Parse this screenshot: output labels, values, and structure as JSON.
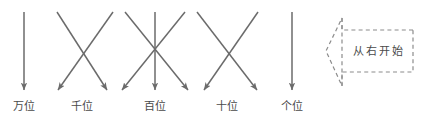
{
  "canvas": {
    "width": 425,
    "height": 126,
    "background_color": "#ffffff",
    "line_color": "#6b6b6b",
    "dashed_color": "#8c8c8c",
    "text_color": "#4a4a4a"
  },
  "labels": {
    "ten_thousands": "万位",
    "thousands": "千位",
    "hundreds": "百位",
    "tens": "十位",
    "ones": "个位"
  },
  "banner": {
    "text": "从右开始",
    "direction": "left"
  },
  "chart_data": {
    "type": "diagram",
    "title": "",
    "place_columns": [
      {
        "label": "万位",
        "x": 24
      },
      {
        "label": "千位",
        "x": 82
      },
      {
        "label": "百位",
        "x": 155
      },
      {
        "label": "十位",
        "x": 227
      },
      {
        "label": "个位",
        "x": 292
      }
    ],
    "arrows": [
      {
        "x1": 24,
        "y1": 12,
        "x2": 24,
        "y2": 90,
        "kind": "vertical"
      },
      {
        "x1": 57,
        "y1": 12,
        "x2": 107,
        "y2": 90,
        "kind": "diagonal-right"
      },
      {
        "x1": 113,
        "y1": 12,
        "x2": 58,
        "y2": 90,
        "kind": "diagonal-left"
      },
      {
        "x1": 125,
        "y1": 12,
        "x2": 188,
        "y2": 90,
        "kind": "diagonal-right"
      },
      {
        "x1": 155,
        "y1": 12,
        "x2": 155,
        "y2": 90,
        "kind": "vertical"
      },
      {
        "x1": 185,
        "y1": 12,
        "x2": 122,
        "y2": 90,
        "kind": "diagonal-left"
      },
      {
        "x1": 197,
        "y1": 12,
        "x2": 257,
        "y2": 90,
        "kind": "diagonal-right"
      },
      {
        "x1": 258,
        "y1": 12,
        "x2": 204,
        "y2": 90,
        "kind": "diagonal-left"
      },
      {
        "x1": 292,
        "y1": 12,
        "x2": 292,
        "y2": 90,
        "kind": "vertical"
      }
    ],
    "annotation": {
      "text": "从右开始",
      "shape": "left-pointing-arrow-banner",
      "style": "dashed",
      "tip_x": 326,
      "right_x": 413,
      "top_y": 30,
      "bottom_y": 72,
      "notch_x": 342,
      "notch_top_y": 18,
      "notch_bottom_y": 86
    }
  }
}
